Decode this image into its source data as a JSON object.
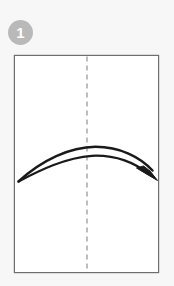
{
  "figure": {
    "background_color": "#f7f7f7"
  },
  "step_badge": {
    "number": "1",
    "shape": "circle",
    "fill_color": "#b9b9b9",
    "text_color": "#fdfdfd"
  },
  "paper": {
    "name": "paper-sheet",
    "shape": "rectangle",
    "orientation": "portrait",
    "fill_color": "#ffffff",
    "border_color": "#6e6e6e",
    "x": 14,
    "y": 55,
    "width": 145,
    "height": 218
  },
  "fold_line": {
    "name": "center-fold-line",
    "style": "dashed",
    "orientation": "vertical",
    "color": "#9a9a9a",
    "x": 87,
    "y_start": 56,
    "y_end": 272,
    "dash": "5 4"
  },
  "fold_arrow": {
    "name": "fold-arrow",
    "direction": "left-to-right",
    "style": "double-curved-line-with-solid-head",
    "color": "#1a1a1a",
    "start": {
      "x": 18,
      "y": 181
    },
    "apex_upper": {
      "x": 95,
      "y": 147
    },
    "apex_lower": {
      "x": 92,
      "y": 156
    },
    "end": {
      "x": 155,
      "y": 175
    },
    "arrowhead": "solid-triangle"
  },
  "labels": {
    "step_caption": ""
  }
}
